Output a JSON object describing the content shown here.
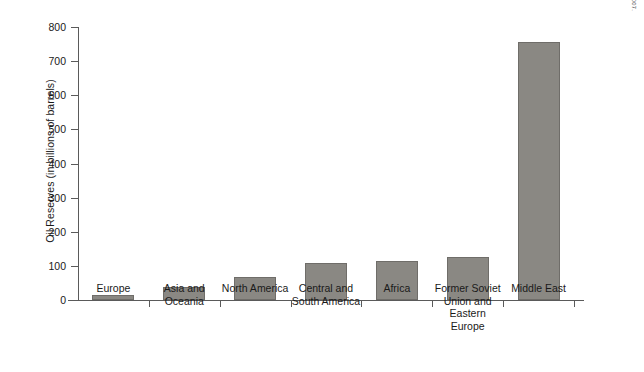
{
  "chart_data": {
    "type": "bar",
    "title": "",
    "xlabel": "",
    "ylabel": "Oil Reserves (in billions of barrels)",
    "ylim": [
      0,
      800
    ],
    "ytick_step": 100,
    "yticks": [
      0,
      100,
      200,
      300,
      400,
      500,
      600,
      700,
      800
    ],
    "grid": false,
    "legend": false,
    "orientation": "vertical",
    "bar_color": "#8a8883",
    "bar_edge_color": "#6f6d69",
    "axis_color": "#5a5a5a",
    "categories": [
      "Europe",
      "Asia and Oceania",
      "North America",
      "Central and South America",
      "Africa",
      "Former Soviet Union and Eastern Europe",
      "Middle East"
    ],
    "category_label_lines": [
      [
        "Europe"
      ],
      [
        "Asia and",
        "Oceania"
      ],
      [
        "North America"
      ],
      [
        "Central and",
        "South America"
      ],
      [
        "Africa"
      ],
      [
        "Former Soviet",
        "Union and Eastern",
        "Europe"
      ],
      [
        "Middle East"
      ]
    ],
    "values": [
      14,
      38,
      68,
      109,
      115,
      125,
      755
    ]
  },
  "source": {
    "note": "Source: U.S. Energy Information Administration and BP Statistical Review for 2007."
  }
}
